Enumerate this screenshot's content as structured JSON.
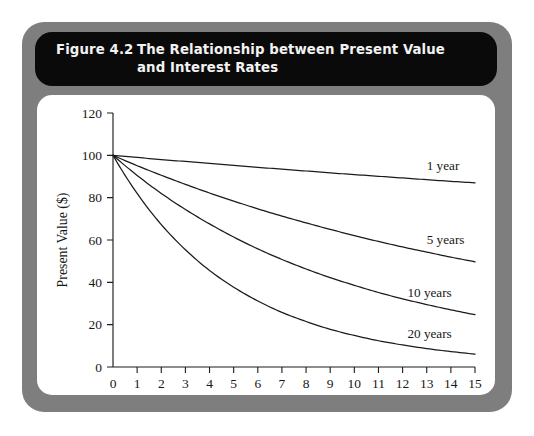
{
  "figure": {
    "number": "Figure 4.2",
    "title_line1": "The Relationship between Present Value",
    "title_line2": "and Interest Rates",
    "frame_color": "#7e7e7e",
    "title_bar_color": "#0a0a0a",
    "panel_color": "#ffffff"
  },
  "chart_data": {
    "type": "line",
    "title": "The Relationship between Present Value and Interest Rates",
    "xlabel": "Interest Rate (%)",
    "ylabel": "Present Value ($)",
    "xlim": [
      0,
      15
    ],
    "ylim": [
      0,
      120
    ],
    "xticks": [
      "0",
      "1",
      "2",
      "3",
      "4",
      "5",
      "6",
      "7",
      "8",
      "9",
      "10",
      "11",
      "12",
      "13",
      "14",
      "15"
    ],
    "yticks": [
      "0",
      "20",
      "40",
      "60",
      "80",
      "100",
      "120"
    ],
    "grid": false,
    "legend_position": "inline-right-of-curves",
    "x": [
      0,
      1,
      2,
      3,
      4,
      5,
      6,
      7,
      8,
      9,
      10,
      11,
      12,
      13,
      14,
      15
    ],
    "series": [
      {
        "name": "1 year",
        "label": "1 year",
        "label_x": 13.0,
        "label_y": 93,
        "values": [
          100,
          99,
          98,
          97.1,
          96.2,
          95.2,
          94.3,
          93.5,
          92.6,
          91.7,
          90.9,
          90.1,
          89.3,
          88.5,
          87.7,
          87.0
        ]
      },
      {
        "name": "5 years",
        "label": "5 years",
        "label_x": 13.0,
        "label_y": 58,
        "values": [
          100,
          95.1,
          90.6,
          86.3,
          82.2,
          78.4,
          74.7,
          71.3,
          68.1,
          65.0,
          62.1,
          59.3,
          56.7,
          54.3,
          51.9,
          49.7
        ]
      },
      {
        "name": "10 years",
        "label": "10 years",
        "label_x": 12.2,
        "label_y": 33,
        "values": [
          100,
          90.5,
          82.0,
          74.4,
          67.6,
          61.4,
          55.8,
          50.8,
          46.3,
          42.2,
          38.6,
          35.2,
          32.2,
          29.5,
          27.0,
          24.7
        ]
      },
      {
        "name": "20 years",
        "label": "20 years",
        "label_x": 12.2,
        "label_y": 13.5,
        "values": [
          100,
          82.0,
          67.3,
          55.4,
          45.6,
          37.7,
          31.2,
          25.8,
          21.5,
          17.8,
          14.9,
          12.4,
          10.4,
          8.7,
          7.3,
          6.1
        ]
      }
    ],
    "formula_note": "PV = 100 / (1 + r)^n"
  }
}
